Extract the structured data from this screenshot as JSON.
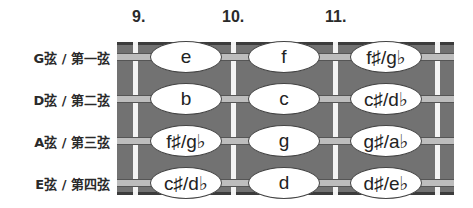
{
  "fret_numbers": [
    "9.",
    "10.",
    "11."
  ],
  "strings": [
    {
      "label": "G弦 / 第一弦",
      "notes": [
        "e",
        "f",
        "f♯/g♭"
      ]
    },
    {
      "label": "D弦 / 第二弦",
      "notes": [
        "b",
        "c",
        "c♯/d♭"
      ]
    },
    {
      "label": "A弦 / 第三弦",
      "notes": [
        "f♯/g♭",
        "g",
        "g♯/a♭"
      ]
    },
    {
      "label": "E弦 / 第四弦",
      "notes": [
        "c♯/d♭",
        "d",
        "d♯/e♭"
      ]
    }
  ],
  "colors": {
    "fretboard": "#727272",
    "fretboard_edge": "#3c3c3c",
    "string": "#bdbdbd",
    "fret": "#f4f4f4",
    "note_fill": "#ffffff"
  }
}
